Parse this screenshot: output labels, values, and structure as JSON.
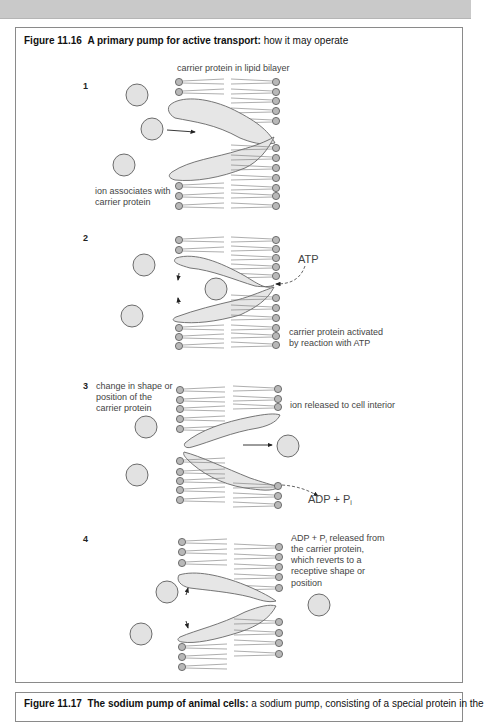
{
  "figure_16": {
    "number": "Figure 11.16",
    "title_bold": "A primary pump for active transport:",
    "title_rest": " how it may operate",
    "steps": [
      {
        "number": "1",
        "labels": {
          "top": "carrier protein in lipid bilayer",
          "ion_line1": "ion associates with",
          "ion_line2": "carrier protein"
        }
      },
      {
        "number": "2",
        "labels": {
          "atp": "ATP",
          "activated_line1": "carrier protein activated",
          "activated_line2": "by reaction with ATP"
        }
      },
      {
        "number": "3",
        "labels": {
          "change_line1": "change in shape or",
          "change_line2": "position of the",
          "change_line3": "carrier protein",
          "released": "ion released to cell interior",
          "adp": "ADP + P",
          "adp_sub": "i"
        }
      },
      {
        "number": "4",
        "labels": {
          "revert_line1_a": "ADP + P",
          "revert_line1_sub": "i",
          "revert_line1_b": " released from",
          "revert_line2": "the carrier protein,",
          "revert_line3": "which reverts to a",
          "revert_line4": "receptive shape or",
          "revert_line5": "position"
        }
      }
    ]
  },
  "figure_17": {
    "number": "Figure 11.17",
    "title_bold": "The sodium pump of animal cells:",
    "title_rest": " a sodium pump, consisting of a special protein in the"
  },
  "colors": {
    "top_band": "#c9c9c9",
    "border": "#8a8a8a",
    "ion_fill": "#e2e2e2",
    "head_fill": "#b8b8b8",
    "protein_fill": "#e6e6e6"
  }
}
